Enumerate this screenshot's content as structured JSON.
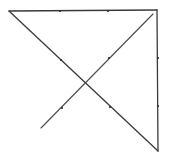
{
  "diagram": {
    "type": "geometric-line-figure",
    "stroke_color": "#3a3a3a",
    "background": "#ffffff",
    "vertices": {
      "top_left": [
        9,
        11
      ],
      "top_right": [
        157,
        10
      ],
      "bottom_right": [
        158,
        151
      ],
      "diagonal_upper_end": [
        153,
        14
      ],
      "diagonal_lower_end": [
        41,
        128
      ],
      "crossing": [
        85,
        84
      ]
    },
    "segments": [
      {
        "name": "top-edge",
        "from": [
          9,
          11
        ],
        "to": [
          157,
          10
        ]
      },
      {
        "name": "right-edge",
        "from": [
          157,
          10
        ],
        "to": [
          158,
          151
        ]
      },
      {
        "name": "main-diagonal",
        "from": [
          9,
          11
        ],
        "to": [
          158,
          151
        ]
      },
      {
        "name": "cross-diagonal",
        "from": [
          41,
          128
        ],
        "to": [
          153,
          14
        ]
      }
    ],
    "tick_marks": [
      {
        "segment": "top-edge",
        "at": [
          60,
          11
        ]
      },
      {
        "segment": "top-edge",
        "at": [
          108,
          11
        ]
      },
      {
        "segment": "right-edge",
        "at": [
          158,
          58
        ]
      },
      {
        "segment": "right-edge",
        "at": [
          158,
          106
        ]
      },
      {
        "segment": "main-diagonal",
        "at": [
          61,
          60
        ]
      },
      {
        "segment": "main-diagonal",
        "at": [
          110,
          107
        ]
      },
      {
        "segment": "cross-diagonal",
        "at": [
          62,
          108
        ]
      },
      {
        "segment": "cross-diagonal",
        "at": [
          109,
          58
        ]
      }
    ]
  }
}
